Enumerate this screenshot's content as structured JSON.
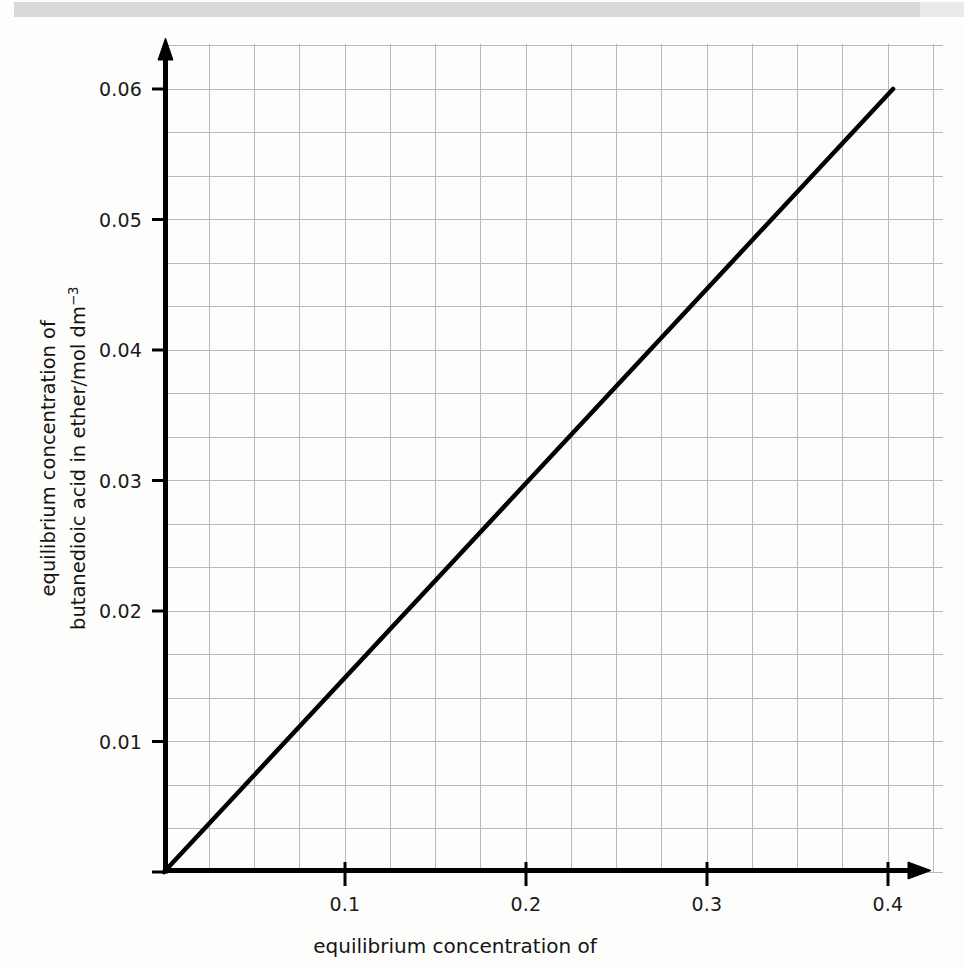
{
  "figure": {
    "background_color": "#fdfdfc",
    "scan_band_color": "#d9d9d9",
    "axis_color": "#000000",
    "grid_color": "#b9b9b9",
    "line_color": "#000000"
  },
  "axes": {
    "y_title_line1": "equilibrium concentration of",
    "y_title_line2_pre": "butanedioic acid in ether/mol dm",
    "y_title_line2_sup": "−3",
    "x_title": "equilibrium concentration of",
    "y_ticks": [
      "0.01",
      "0.02",
      "0.03",
      "0.04",
      "0.05",
      "0.06"
    ],
    "x_ticks": [
      "0.1",
      "0.2",
      "0.3",
      "0.4"
    ]
  },
  "chart_data": {
    "type": "line",
    "title": "",
    "xlabel": "equilibrium concentration of",
    "ylabel": "equilibrium concentration of butanedioic acid in ether/mol dm^-3",
    "xlim": [
      0,
      0.425
    ],
    "ylim": [
      0,
      0.0635
    ],
    "xticks": [
      0.1,
      0.2,
      0.3,
      0.4
    ],
    "yticks": [
      0.01,
      0.02,
      0.03,
      0.04,
      0.05,
      0.06
    ],
    "xtick_labels": [
      "0.1",
      "0.2",
      "0.3",
      "0.4"
    ],
    "ytick_labels": [
      "0.01",
      "0.02",
      "0.03",
      "0.04",
      "0.05",
      "0.06"
    ],
    "grid": true,
    "grid_minor_x_step": 0.025,
    "grid_minor_y_step": 0.003333,
    "legend": null,
    "series": [
      {
        "name": "butanedioic acid partition",
        "x": [
          0.0,
          0.05,
          0.1,
          0.15,
          0.2,
          0.25,
          0.3,
          0.35,
          0.4
        ],
        "y": [
          0.0,
          0.00746,
          0.01492,
          0.02239,
          0.02985,
          0.03731,
          0.04477,
          0.05224,
          0.0597
        ],
        "slope": 0.14925,
        "intercept": 0.0,
        "style": "solid",
        "color": "#000000",
        "width": 4
      }
    ]
  }
}
